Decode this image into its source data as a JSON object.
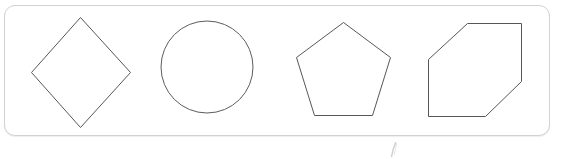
{
  "canvas": {
    "width": 569,
    "height": 159,
    "background_color": "#ffffff"
  },
  "panel": {
    "name": "shapes-container",
    "x": 4,
    "y": 5,
    "width": 546,
    "height": 131,
    "fill_color": "#ffffff",
    "border_color": "#d2d2d2",
    "border_radius": 11
  },
  "shapes": [
    {
      "id": "diamond",
      "label": "Diamond",
      "sides": 4,
      "stroke_color": "#575757",
      "fill_color": "#ffffff",
      "stroke_width": 1,
      "points": "80.5,17.5 130.5,72.5 80.5,127.5 31.5,72.5"
    },
    {
      "id": "circle",
      "label": "Circle",
      "sides": 0,
      "stroke_color": "#5c5c5c",
      "fill_color": "#ffffff",
      "stroke_width": 1,
      "cx": 207,
      "cy": 67,
      "r": 46
    },
    {
      "id": "pentagon",
      "label": "Pentagon",
      "sides": 5,
      "stroke_color": "#575757",
      "fill_color": "#ffffff",
      "stroke_width": 1,
      "points": "343.5,22.5 390.5,57.5 372.5,115.5 314.5,115.5 296.5,57.5"
    },
    {
      "id": "hexagon",
      "label": "Hexagon",
      "sides": 6,
      "stroke_color": "#575757",
      "fill_color": "#ffffff",
      "stroke_width": 1,
      "points": "467.5,23.5 521.5,23.5 521.5,81.5 485.5,116.5 428.5,116.5 428.5,59.5"
    }
  ],
  "stray_mark": {
    "id": "stray-mark",
    "label": "faint stroke artifact",
    "x": 389,
    "y": 142,
    "color": "#8a8a8a",
    "opacity": 0.4
  }
}
